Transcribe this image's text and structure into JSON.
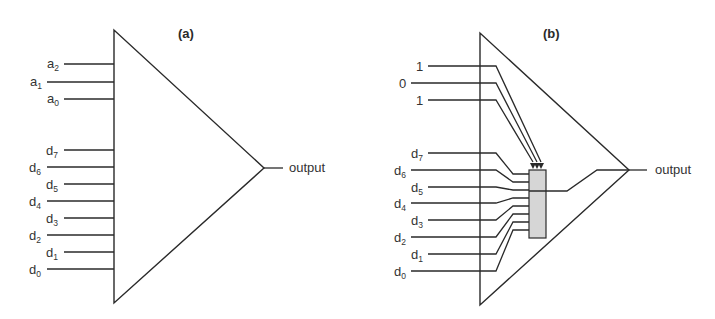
{
  "colors": {
    "line": "#2a2a2a",
    "text": "#333333",
    "selector_fill": "#d6d6d6",
    "background": "#ffffff"
  },
  "panel_a": {
    "label": "(a)",
    "address_inputs": [
      {
        "base": "a",
        "sub": "2"
      },
      {
        "base": "a",
        "sub": "1"
      },
      {
        "base": "a",
        "sub": "0"
      }
    ],
    "data_inputs": [
      {
        "base": "d",
        "sub": "7"
      },
      {
        "base": "d",
        "sub": "6"
      },
      {
        "base": "d",
        "sub": "5"
      },
      {
        "base": "d",
        "sub": "4"
      },
      {
        "base": "d",
        "sub": "3"
      },
      {
        "base": "d",
        "sub": "2"
      },
      {
        "base": "d",
        "sub": "1"
      },
      {
        "base": "d",
        "sub": "0"
      }
    ],
    "output_label": "output"
  },
  "panel_b": {
    "label": "(b)",
    "address_values": [
      "1",
      "0",
      "1"
    ],
    "data_inputs": [
      {
        "base": "d",
        "sub": "7"
      },
      {
        "base": "d",
        "sub": "6"
      },
      {
        "base": "d",
        "sub": "5"
      },
      {
        "base": "d",
        "sub": "4"
      },
      {
        "base": "d",
        "sub": "3"
      },
      {
        "base": "d",
        "sub": "2"
      },
      {
        "base": "d",
        "sub": "1"
      },
      {
        "base": "d",
        "sub": "0"
      }
    ],
    "output_label": "output"
  }
}
